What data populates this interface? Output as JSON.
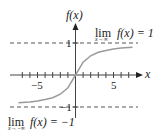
{
  "chart_data": {
    "type": "line",
    "title": "",
    "xlabel": "x",
    "ylabel": "f(x)",
    "xlim": [
      -8,
      8
    ],
    "ylim": [
      -1.5,
      1.5
    ],
    "x_ticks": [
      -7,
      -6,
      -5,
      -4,
      -3,
      -2,
      -1,
      1,
      2,
      3,
      4,
      5,
      6,
      7
    ],
    "x_tick_labels": [
      "-5",
      "5"
    ],
    "y_tick_labels": [
      "1",
      "-1"
    ],
    "series": [
      {
        "name": "f(x)",
        "color": "#9a9a9a",
        "x": [
          -7.5,
          -6,
          -5,
          -4,
          -3,
          -2,
          -1,
          0,
          1,
          2,
          3,
          4,
          5,
          6,
          7.5
        ],
        "y": [
          -0.87,
          -0.84,
          -0.81,
          -0.77,
          -0.71,
          -0.6,
          -0.4,
          0,
          0.4,
          0.6,
          0.71,
          0.77,
          0.81,
          0.84,
          0.87
        ]
      }
    ],
    "asymptotes": [
      {
        "y": 1,
        "style": "dashed"
      },
      {
        "y": -1,
        "style": "dashed"
      }
    ],
    "annotations": [
      {
        "text": "lim f(x) = 1",
        "subscript": "x→∞"
      },
      {
        "text": "lim f(x) = −1",
        "subscript": "x→−∞"
      }
    ]
  },
  "labels": {
    "y_axis": "f(x)",
    "x_axis": "x",
    "tick_neg5": "−5",
    "tick_pos5": "5",
    "y_one": "1",
    "y_neg_one": "−1",
    "lim_top_main": "lim",
    "lim_top_f": "f(x) = 1",
    "lim_top_sub": "x→∞",
    "lim_bot_main": "lim",
    "lim_bot_f": "f(x) = −1",
    "lim_bot_sub": "x→−∞"
  }
}
